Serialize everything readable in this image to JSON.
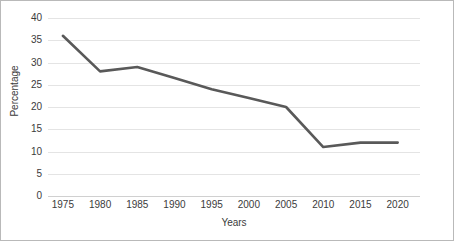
{
  "chart_data": {
    "type": "line",
    "title": "",
    "xlabel": "Years",
    "ylabel": "Percentage",
    "x": [
      1975,
      1980,
      1985,
      1990,
      1995,
      2000,
      2005,
      2010,
      2015,
      2020
    ],
    "categories": [
      "1975",
      "1980",
      "1985",
      "1990",
      "1995",
      "2000",
      "2005",
      "2010",
      "2015",
      "2020"
    ],
    "values": [
      36,
      28,
      29,
      26.5,
      24,
      22,
      20,
      11,
      12,
      12
    ],
    "series": [
      {
        "name": "Percentage",
        "values": [
          36,
          28,
          29,
          26.5,
          24,
          22,
          20,
          11,
          12,
          12
        ]
      }
    ],
    "ylim": [
      0,
      40
    ],
    "xlim": [
      1973,
      2023
    ],
    "yticks": [
      0,
      5,
      10,
      15,
      20,
      25,
      30,
      35,
      40
    ],
    "ytick_labels": [
      "0",
      "5",
      "10",
      "15",
      "20",
      "25",
      "30",
      "35",
      "40"
    ],
    "xticks": [
      1975,
      1980,
      1985,
      1990,
      1995,
      2000,
      2005,
      2010,
      2015,
      2020
    ],
    "xtick_labels": [
      "1975",
      "1980",
      "1985",
      "1990",
      "1995",
      "2000",
      "2005",
      "2010",
      "2015",
      "2020"
    ],
    "grid": "horizontal",
    "legend": "none",
    "line_color": "#595959",
    "grid_color": "#e4e4e4",
    "border_color": "#b9b9b9",
    "background_color": "#ffffff",
    "text_color": "#3b3b3b"
  }
}
